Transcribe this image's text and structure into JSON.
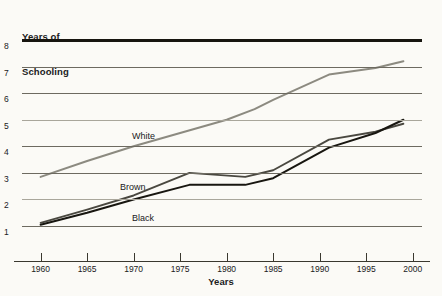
{
  "figure": {
    "background_color": "#fbfaf6",
    "y_axis_caption_line1": "Years of",
    "y_axis_caption_line2": "Schooling",
    "x_axis_caption": "Years"
  },
  "chart_data": {
    "type": "line",
    "title": "",
    "xlabel": "Years",
    "ylabel": "Years of Schooling",
    "xlim": [
      1958,
      2001
    ],
    "ylim": [
      0.55,
      8
    ],
    "xticks": [
      1960,
      1965,
      1970,
      1975,
      1980,
      1985,
      1990,
      1995,
      2000
    ],
    "xtick_labels": [
      "1960",
      "1965",
      "1970",
      "1975",
      "1980",
      "1985",
      "1990",
      "1995",
      "2000"
    ],
    "yticks": [
      1,
      2,
      3,
      4,
      5,
      6,
      7,
      8
    ],
    "ytick_labels": [
      "1",
      "2",
      "3",
      "4",
      "5",
      "6",
      "7",
      "8"
    ],
    "grid": true,
    "grid_orientation": "horizontal",
    "legend": "inline-annotations",
    "series": [
      {
        "name": "White",
        "color": "#8c8a80",
        "line_width": 2.0,
        "x": [
          1960,
          1965,
          1970,
          1975,
          1980,
          1983,
          1985,
          1991,
          1996,
          1999
        ],
        "values": [
          2.85,
          3.45,
          4.0,
          4.5,
          5.0,
          5.4,
          5.75,
          6.7,
          6.95,
          7.2
        ]
      },
      {
        "name": "Brown",
        "color": "#4a4840",
        "line_width": 1.9,
        "x": [
          1960,
          1965,
          1970,
          1976,
          1982,
          1985,
          1991,
          1996,
          1999
        ],
        "values": [
          1.12,
          1.62,
          2.15,
          3.0,
          2.85,
          3.1,
          4.25,
          4.55,
          4.85
        ]
      },
      {
        "name": "Black",
        "color": "#181610",
        "line_width": 2.0,
        "x": [
          1960,
          1965,
          1970,
          1976,
          1982,
          1985,
          1991,
          1996,
          1999
        ],
        "values": [
          1.05,
          1.5,
          2.0,
          2.55,
          2.55,
          2.8,
          3.95,
          4.5,
          5.0
        ]
      }
    ],
    "annotations": [
      {
        "label": "White",
        "x": 1971.5,
        "y": 4.62
      },
      {
        "label": "Brown",
        "x": 1970.5,
        "y": 2.85
      },
      {
        "label": "Black",
        "x": 1971.5,
        "y": 1.95
      }
    ]
  }
}
